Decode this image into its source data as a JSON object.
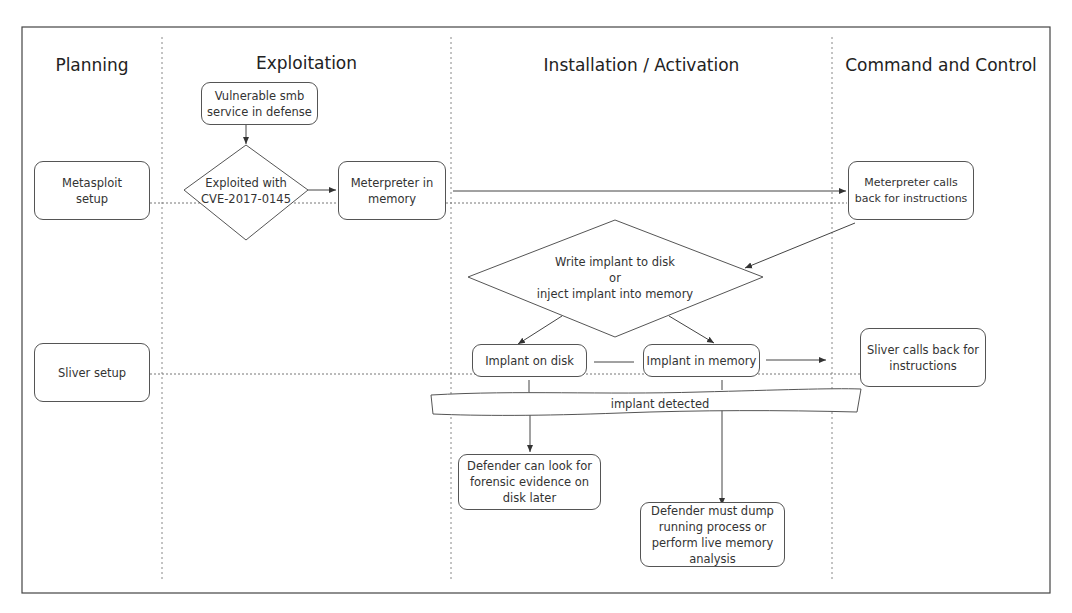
{
  "lanes": [
    {
      "title": "Planning"
    },
    {
      "title": "Exploitation"
    },
    {
      "title": "Installation / Activation"
    },
    {
      "title": "Command and Control"
    }
  ],
  "nodes": {
    "metasploit_setup": "Metasploit\nsetup",
    "vulnerable_smb": "Vulnerable smb\nservice in defense",
    "exploited_cve": "Exploited with\nCVE-2017-0145",
    "meterpreter_memory": "Meterpreter in\nmemory",
    "meterpreter_calls_back": "Meterpreter calls\nback for instructions",
    "write_or_inject": "Write implant to disk\nor\ninject implant into memory",
    "implant_on_disk": "Implant on disk",
    "implant_in_memory": "Implant in memory",
    "sliver_setup": "Sliver setup",
    "sliver_calls_back": "Sliver calls back for\ninstructions",
    "implant_detected": "implant detected",
    "defender_disk": "Defender can look for\nforensic evidence on\ndisk later",
    "defender_memory": "Defender must dump\nrunning process or\nperform live memory\nanalysis"
  },
  "colors": {
    "line": "#555555",
    "dotted": "#777777",
    "frame": "#444444"
  }
}
